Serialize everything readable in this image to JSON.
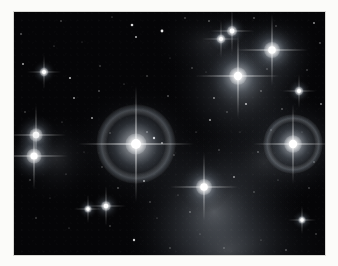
{
  "image": {
    "subject": "Pleiades open star cluster (M45) with reflection nebulosity",
    "type": "astrophotograph",
    "rendering": "grayscale",
    "frame": {
      "mat_color": "#fbfbf9",
      "edge_color": "#d8d8d4",
      "left": 14,
      "top": 12,
      "width": 311,
      "height": 243
    },
    "sky": {
      "background_color": "#050507",
      "star_color": "#ffffff",
      "nebula_color": "#b9c2cc"
    },
    "nebulae": [
      {
        "name": "merope-nebula",
        "cx": 200,
        "cy": 200,
        "rx": 95,
        "ry": 95,
        "intensity": 0.4
      },
      {
        "name": "maia-nebula",
        "cx": 228,
        "cy": 72,
        "rx": 78,
        "ry": 82,
        "intensity": 0.36
      },
      {
        "name": "alcyone-glow",
        "cx": 124,
        "cy": 135,
        "rx": 72,
        "ry": 66,
        "intensity": 0.22
      },
      {
        "name": "electra-glow",
        "cx": 282,
        "cy": 133,
        "rx": 58,
        "ry": 56,
        "intensity": 0.26
      },
      {
        "name": "atlas-glow",
        "cx": 262,
        "cy": 40,
        "rx": 46,
        "ry": 44,
        "intensity": 0.26
      },
      {
        "name": "southern-veil",
        "cx": 215,
        "cy": 238,
        "rx": 110,
        "ry": 70,
        "intensity": 0.24
      },
      {
        "name": "west-haze",
        "cx": 42,
        "cy": 146,
        "rx": 48,
        "ry": 48,
        "intensity": 0.16
      },
      {
        "name": "bridge-haze",
        "cx": 250,
        "cy": 150,
        "rx": 70,
        "ry": 60,
        "intensity": 0.14
      },
      {
        "name": "north-haze",
        "cx": 195,
        "cy": 30,
        "rx": 60,
        "ry": 40,
        "intensity": 0.12
      }
    ],
    "bright_stars": [
      {
        "name": "alcyone",
        "cx": 122,
        "cy": 132,
        "radius": 5.0,
        "glow": 46,
        "spikes": 58,
        "halo": 40
      },
      {
        "name": "maia",
        "cx": 224,
        "cy": 64,
        "radius": 4.2,
        "glow": 34,
        "spikes": 42,
        "halo": 0
      },
      {
        "name": "merope",
        "cx": 190,
        "cy": 175,
        "radius": 3.8,
        "glow": 26,
        "spikes": 34,
        "halo": 0
      },
      {
        "name": "electra",
        "cx": 279,
        "cy": 132,
        "radius": 4.2,
        "glow": 32,
        "spikes": 40,
        "halo": 30
      },
      {
        "name": "atlas",
        "cx": 258,
        "cy": 38,
        "radius": 3.8,
        "glow": 26,
        "spikes": 36,
        "halo": 0
      },
      {
        "name": "taygeta",
        "cx": 22,
        "cy": 123,
        "radius": 3.2,
        "glow": 22,
        "spikes": 30,
        "halo": 0
      },
      {
        "name": "pleione",
        "cx": 20,
        "cy": 144,
        "radius": 3.6,
        "glow": 26,
        "spikes": 34,
        "halo": 0
      },
      {
        "name": "celaeno",
        "cx": 218,
        "cy": 19,
        "radius": 2.4,
        "glow": 15,
        "spikes": 22,
        "halo": 0
      },
      {
        "name": "asterope",
        "cx": 207,
        "cy": 27,
        "radius": 2.1,
        "glow": 13,
        "spikes": 19,
        "halo": 0
      },
      {
        "name": "field-star-south",
        "cx": 92,
        "cy": 194,
        "radius": 2.3,
        "glow": 14,
        "spikes": 20,
        "halo": 0
      },
      {
        "name": "field-star-southwest",
        "cx": 74,
        "cy": 197,
        "radius": 1.7,
        "glow": 10,
        "spikes": 14,
        "halo": 0
      },
      {
        "name": "field-star-north",
        "cx": 30,
        "cy": 60,
        "radius": 2.0,
        "glow": 12,
        "spikes": 17,
        "halo": 0
      },
      {
        "name": "field-star-center",
        "cx": 285,
        "cy": 79,
        "radius": 2.0,
        "glow": 12,
        "spikes": 17,
        "halo": 0
      },
      {
        "name": "field-star-east",
        "cx": 288,
        "cy": 208,
        "radius": 1.7,
        "glow": 10,
        "spikes": 14,
        "halo": 0
      }
    ],
    "faint_stars": [
      {
        "cx": 7,
        "cy": 22,
        "r": 0.8,
        "b": 0.55
      },
      {
        "cx": 47,
        "cy": 9,
        "r": 0.7,
        "b": 0.5
      },
      {
        "cx": 98,
        "cy": 5,
        "r": 0.6,
        "b": 0.45
      },
      {
        "cx": 118,
        "cy": 13,
        "r": 1.3,
        "b": 0.85
      },
      {
        "cx": 122,
        "cy": 25,
        "r": 1.0,
        "b": 0.7
      },
      {
        "cx": 148,
        "cy": 19,
        "r": 1.4,
        "b": 0.9
      },
      {
        "cx": 171,
        "cy": 6,
        "r": 0.7,
        "b": 0.5
      },
      {
        "cx": 195,
        "cy": 9,
        "r": 0.8,
        "b": 0.55
      },
      {
        "cx": 240,
        "cy": 6,
        "r": 0.8,
        "b": 0.5
      },
      {
        "cx": 262,
        "cy": 14,
        "r": 0.7,
        "b": 0.45
      },
      {
        "cx": 300,
        "cy": 11,
        "r": 0.9,
        "b": 0.6
      },
      {
        "cx": 306,
        "cy": 31,
        "r": 0.8,
        "b": 0.5
      },
      {
        "cx": 9,
        "cy": 52,
        "r": 1.0,
        "b": 0.65
      },
      {
        "cx": 56,
        "cy": 66,
        "r": 1.1,
        "b": 0.7
      },
      {
        "cx": 86,
        "cy": 54,
        "r": 0.7,
        "b": 0.45
      },
      {
        "cx": 60,
        "cy": 86,
        "r": 1.0,
        "b": 0.6
      },
      {
        "cx": 85,
        "cy": 79,
        "r": 0.8,
        "b": 0.5
      },
      {
        "cx": 110,
        "cy": 72,
        "r": 0.6,
        "b": 0.4
      },
      {
        "cx": 133,
        "cy": 64,
        "r": 0.7,
        "b": 0.45
      },
      {
        "cx": 154,
        "cy": 84,
        "r": 0.8,
        "b": 0.5
      },
      {
        "cx": 178,
        "cy": 56,
        "r": 0.7,
        "b": 0.45
      },
      {
        "cx": 200,
        "cy": 86,
        "r": 0.9,
        "b": 0.55
      },
      {
        "cx": 213,
        "cy": 100,
        "r": 0.7,
        "b": 0.45
      },
      {
        "cx": 232,
        "cy": 92,
        "r": 1.1,
        "b": 0.7
      },
      {
        "cx": 247,
        "cy": 79,
        "r": 0.8,
        "b": 0.5
      },
      {
        "cx": 253,
        "cy": 57,
        "r": 0.7,
        "b": 0.45
      },
      {
        "cx": 268,
        "cy": 97,
        "r": 0.8,
        "b": 0.5
      },
      {
        "cx": 293,
        "cy": 58,
        "r": 0.7,
        "b": 0.45
      },
      {
        "cx": 307,
        "cy": 92,
        "r": 0.9,
        "b": 0.55
      },
      {
        "cx": 11,
        "cy": 100,
        "r": 0.7,
        "b": 0.45
      },
      {
        "cx": 48,
        "cy": 110,
        "r": 0.6,
        "b": 0.4
      },
      {
        "cx": 78,
        "cy": 106,
        "r": 1.0,
        "b": 0.6
      },
      {
        "cx": 96,
        "cy": 121,
        "r": 0.7,
        "b": 0.45
      },
      {
        "cx": 140,
        "cy": 126,
        "r": 1.2,
        "b": 0.85
      },
      {
        "cx": 148,
        "cy": 131,
        "r": 0.9,
        "b": 0.65
      },
      {
        "cx": 133,
        "cy": 120,
        "r": 0.8,
        "b": 0.6
      },
      {
        "cx": 160,
        "cy": 143,
        "r": 0.7,
        "b": 0.45
      },
      {
        "cx": 182,
        "cy": 120,
        "r": 0.6,
        "b": 0.4
      },
      {
        "cx": 196,
        "cy": 108,
        "r": 1.0,
        "b": 0.6
      },
      {
        "cx": 205,
        "cy": 138,
        "r": 0.7,
        "b": 0.45
      },
      {
        "cx": 244,
        "cy": 140,
        "r": 0.8,
        "b": 0.5
      },
      {
        "cx": 257,
        "cy": 118,
        "r": 0.7,
        "b": 0.45
      },
      {
        "cx": 300,
        "cy": 150,
        "r": 0.8,
        "b": 0.5
      },
      {
        "cx": 16,
        "cy": 168,
        "r": 0.7,
        "b": 0.45
      },
      {
        "cx": 52,
        "cy": 162,
        "r": 0.6,
        "b": 0.4
      },
      {
        "cx": 88,
        "cy": 155,
        "r": 0.7,
        "b": 0.45
      },
      {
        "cx": 104,
        "cy": 176,
        "r": 0.8,
        "b": 0.5
      },
      {
        "cx": 130,
        "cy": 169,
        "r": 1.0,
        "b": 0.65
      },
      {
        "cx": 136,
        "cy": 190,
        "r": 0.7,
        "b": 0.45
      },
      {
        "cx": 164,
        "cy": 183,
        "r": 0.6,
        "b": 0.4
      },
      {
        "cx": 176,
        "cy": 200,
        "r": 0.8,
        "b": 0.5
      },
      {
        "cx": 220,
        "cy": 165,
        "r": 0.9,
        "b": 0.6
      },
      {
        "cx": 240,
        "cy": 180,
        "r": 0.7,
        "b": 0.45
      },
      {
        "cx": 264,
        "cy": 168,
        "r": 0.6,
        "b": 0.4
      },
      {
        "cx": 295,
        "cy": 176,
        "r": 0.7,
        "b": 0.45
      },
      {
        "cx": 22,
        "cy": 206,
        "r": 0.7,
        "b": 0.45
      },
      {
        "cx": 55,
        "cy": 216,
        "r": 0.6,
        "b": 0.4
      },
      {
        "cx": 96,
        "cy": 214,
        "r": 0.7,
        "b": 0.45
      },
      {
        "cx": 120,
        "cy": 228,
        "r": 1.2,
        "b": 0.8
      },
      {
        "cx": 143,
        "cy": 206,
        "r": 0.6,
        "b": 0.4
      },
      {
        "cx": 156,
        "cy": 236,
        "r": 0.7,
        "b": 0.45
      },
      {
        "cx": 186,
        "cy": 222,
        "r": 0.6,
        "b": 0.4
      },
      {
        "cx": 210,
        "cy": 236,
        "r": 0.7,
        "b": 0.45
      },
      {
        "cx": 247,
        "cy": 228,
        "r": 0.6,
        "b": 0.4
      },
      {
        "cx": 272,
        "cy": 238,
        "r": 0.8,
        "b": 0.5
      },
      {
        "cx": 302,
        "cy": 222,
        "r": 0.7,
        "b": 0.45
      },
      {
        "cx": 40,
        "cy": 34,
        "r": 0.6,
        "b": 0.4
      },
      {
        "cx": 68,
        "cy": 30,
        "r": 0.5,
        "b": 0.35
      },
      {
        "cx": 156,
        "cy": 46,
        "r": 0.5,
        "b": 0.35
      },
      {
        "cx": 226,
        "cy": 120,
        "r": 0.5,
        "b": 0.35
      },
      {
        "cx": 70,
        "cy": 140,
        "r": 0.5,
        "b": 0.35
      },
      {
        "cx": 36,
        "cy": 186,
        "r": 0.5,
        "b": 0.35
      },
      {
        "cx": 192,
        "cy": 60,
        "r": 0.5,
        "b": 0.35
      },
      {
        "cx": 288,
        "cy": 120,
        "r": 0.5,
        "b": 0.35
      }
    ]
  }
}
